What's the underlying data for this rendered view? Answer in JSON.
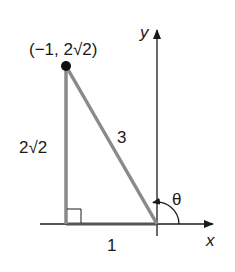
{
  "diagram": {
    "type": "right-triangle-on-coordinate-plane",
    "point_label": "(−1, 2√2)",
    "point": {
      "x": -1,
      "y": "2√2"
    },
    "axis_labels": {
      "x": "x",
      "y": "y"
    },
    "side_labels": {
      "vertical": "2√2",
      "hypotenuse": "3",
      "horizontal": "1"
    },
    "angle_label": "θ",
    "colors": {
      "triangle": "#8a8a8a",
      "axes": "#1a1a1a",
      "point": "#111111"
    }
  }
}
